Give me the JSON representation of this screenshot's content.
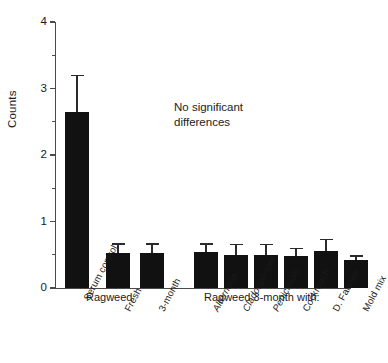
{
  "chart_data": {
    "type": "bar",
    "title": "",
    "xlabel": "",
    "ylabel": "Counts",
    "ylim": [
      0,
      4
    ],
    "yticks": [
      0,
      1,
      2,
      3,
      4
    ],
    "ytick_labels": [
      "0",
      "1",
      "2",
      "3",
      "4"
    ],
    "yminor_ticks": [
      0.5,
      1.5,
      2.5,
      3.5
    ],
    "grid": false,
    "legend": "none",
    "categories": [
      "Serum control",
      "Fresh",
      "3-month",
      "Alternaria",
      "Cladosporium",
      "Penicillium",
      "Cockroach",
      "D. Farinae",
      "Mold mix"
    ],
    "values": [
      2.65,
      0.53,
      0.53,
      0.54,
      0.5,
      0.5,
      0.48,
      0.56,
      0.42
    ],
    "errors": [
      0.55,
      0.14,
      0.14,
      0.13,
      0.16,
      0.16,
      0.12,
      0.18,
      0.07
    ],
    "bar_color": "#111111",
    "error_color": "#2a2a2a",
    "axis_color": "#4a4a4a",
    "annotations": [
      {
        "text": "No significant\ndifferences"
      }
    ],
    "group_labels": [
      {
        "text": "Ragweed",
        "spans": [
          "Fresh",
          "3-month"
        ]
      },
      {
        "text": "Ragweed 3-month with:",
        "spans": [
          "Alternaria",
          "Cladosporium",
          "Penicillium",
          "Cockroach",
          "D. Farinae",
          "Mold mix"
        ]
      }
    ],
    "italic_categories": [
      "Alternaria",
      "Cladosporium",
      "Penicillium"
    ]
  }
}
